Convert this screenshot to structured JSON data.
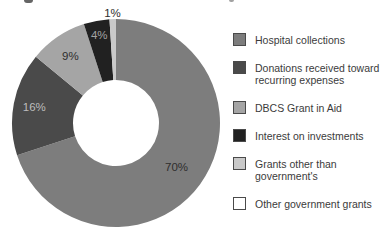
{
  "chart_data": {
    "type": "donut",
    "title": "",
    "legend_position": "right",
    "start_angle_deg": 0,
    "direction": "clockwise",
    "donut_hole_ratio": 0.41,
    "slices": [
      {
        "name": "Hospital collections",
        "legend_label": "Hospital collections",
        "value": 70,
        "pct_label": "70%",
        "color": "#7d7d7d",
        "pct_label_color": "#2e2e2e"
      },
      {
        "name": "Donations received toward recurring expenses",
        "legend_label": "Donations received toward\nrecurring expenses",
        "value": 16,
        "pct_label": "16%",
        "color": "#4a4a4a",
        "pct_label_color": "#bdbdbd"
      },
      {
        "name": "DBCS Grant in Aid",
        "legend_label": "DBCS Grant in Aid",
        "value": 9,
        "pct_label": "9%",
        "color": "#a5a5a5",
        "pct_label_color": "#2e2e2e"
      },
      {
        "name": "Interest on investments",
        "legend_label": "Interest on investments",
        "value": 4,
        "pct_label": "4%",
        "color": "#212121",
        "pct_label_color": "#a3a3a3"
      },
      {
        "name": "Grants other than government's",
        "legend_label": "Grants other than\ngovernment's",
        "value": 1,
        "pct_label": "1%",
        "color": "#c9c9c9",
        "pct_label_color": "#2e2e2e"
      },
      {
        "name": "Other government grants",
        "legend_label": "Other government grants",
        "value": 0,
        "pct_label": "",
        "color": "#ffffff",
        "pct_label_color": "#2e2e2e"
      }
    ],
    "colors": {
      "legend_text": "#3b3b3b",
      "swatch_border": "#4a4a4a",
      "hole": "#ffffff"
    }
  }
}
